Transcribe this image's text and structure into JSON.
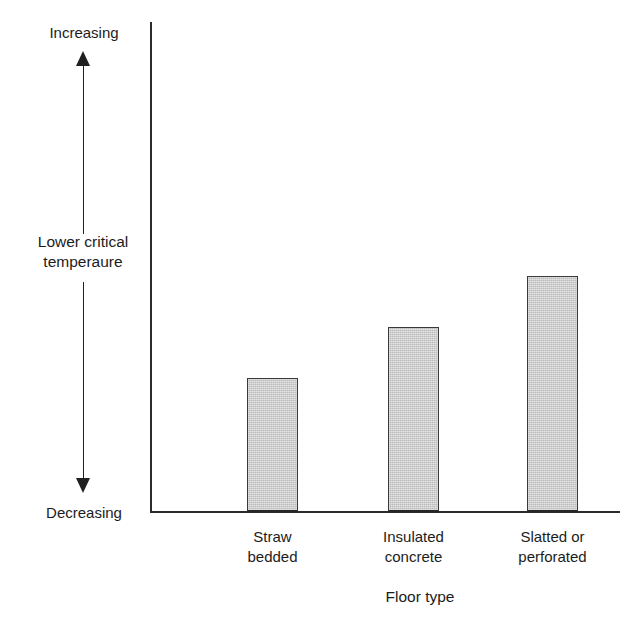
{
  "chart_data": {
    "type": "bar",
    "title": "",
    "subtitle": "",
    "xlabel": "Floor type",
    "ylabel": "Lower critical temperaure",
    "categories": [
      "Straw bedded",
      "Insulated concrete",
      "Slatted or perforated"
    ],
    "category_lines": [
      [
        "Straw",
        "bedded"
      ],
      [
        "Insulated",
        "concrete"
      ],
      [
        "Slatted or",
        "perforated"
      ]
    ],
    "values": [
      1.0,
      1.38,
      1.76
    ],
    "value_units": "relative (unlabelled ordinal axis)",
    "ylim": [
      0,
      2.2
    ],
    "y_axis_ticks": [],
    "y_axis_direction_labels": {
      "top": "Increasing",
      "bottom": "Decreasing"
    },
    "grid": false,
    "legend": false,
    "legend_position": "none",
    "bar_fill_color": "#c9c9c9",
    "bar_edge_color": "#3a3a3a",
    "axis_color": "#2b2b2b",
    "background_color": "#ffffff",
    "annotations": [
      "Vertical double-headed arrow at left indicates the lower critical temperature scale increases upward and decreases downward.",
      "Axis has no numeric tick marks or values; it is a qualitative/ordinal scale."
    ]
  },
  "figure": {
    "x_axis_title": "Floor type",
    "y_axis_title_line1": "Lower critical",
    "y_axis_title_line2": "temperaure",
    "arrow_top_label": "Increasing",
    "arrow_bottom_label": "Decreasing",
    "bars": [
      {
        "label_line1": "Straw",
        "label_line2": "bedded",
        "value": 1.0
      },
      {
        "label_line1": "Insulated",
        "label_line2": "concrete",
        "value": 1.38
      },
      {
        "label_line1": "Slatted or",
        "label_line2": "perforated",
        "value": 1.76
      }
    ]
  }
}
